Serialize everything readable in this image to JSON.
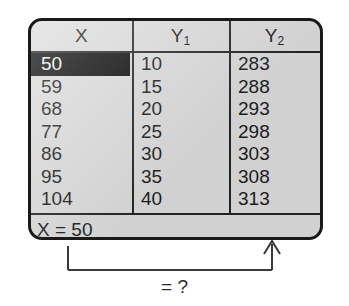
{
  "screen": {
    "table": {
      "columns": [
        {
          "label": "X",
          "sub": ""
        },
        {
          "label": "Y",
          "sub": "1"
        },
        {
          "label": "Y",
          "sub": "2"
        }
      ],
      "rows": [
        {
          "x": "50",
          "y1": "10",
          "y2": "283",
          "selected": true
        },
        {
          "x": "59",
          "y1": "15",
          "y2": "288",
          "selected": false
        },
        {
          "x": "68",
          "y1": "20",
          "y2": "293",
          "selected": false
        },
        {
          "x": "77",
          "y1": "25",
          "y2": "298",
          "selected": false
        },
        {
          "x": "86",
          "y1": "30",
          "y2": "303",
          "selected": false
        },
        {
          "x": "95",
          "y1": "35",
          "y2": "308",
          "selected": false
        },
        {
          "x": "104",
          "y1": "40",
          "y2": "313",
          "selected": false
        }
      ]
    },
    "status": "X = 50"
  },
  "annotation": {
    "label": "= ?"
  },
  "colors": {
    "screen_background": "#dcdcdc",
    "screen_border": "#1a1a1a",
    "text": "#1c1c1c",
    "highlight_background": "#0a0a0a",
    "highlight_text": "#f2f2f2",
    "page_background": "#ffffff"
  }
}
